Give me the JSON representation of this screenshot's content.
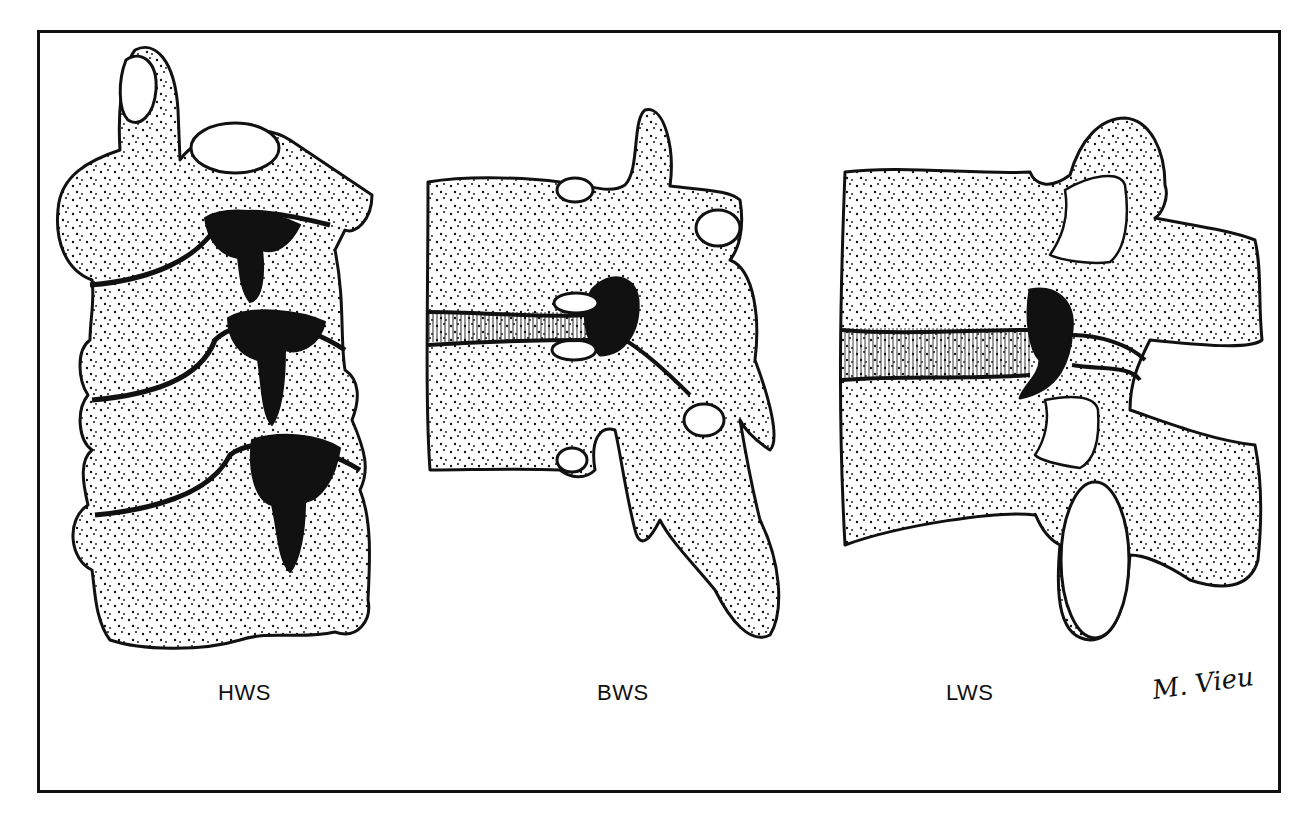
{
  "figure": {
    "panels": [
      {
        "id": "hws",
        "label": "HWS"
      },
      {
        "id": "bws",
        "label": "BWS"
      },
      {
        "id": "lws",
        "label": "LWS"
      }
    ],
    "signature": "M. Vieu",
    "colors": {
      "ink": "#111111",
      "background": "#ffffff"
    }
  }
}
